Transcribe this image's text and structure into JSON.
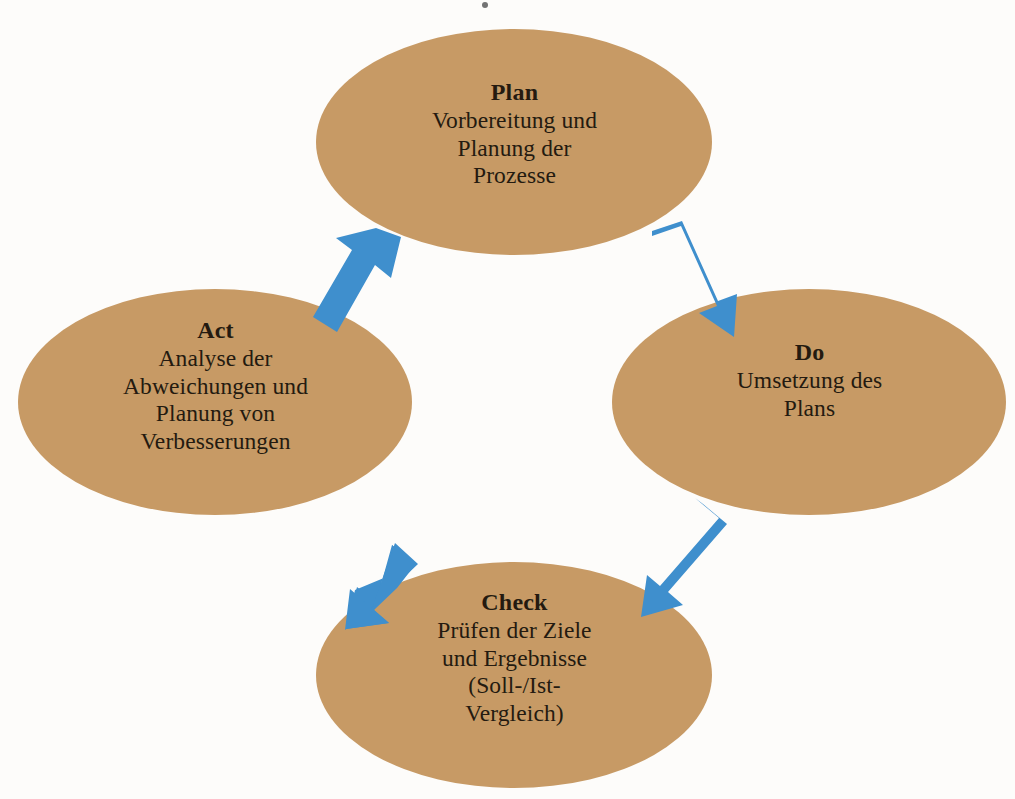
{
  "diagram": {
    "type": "pdca-cycle",
    "direction": "clockwise",
    "colors": {
      "node_fill": "#c79a65",
      "arrow_fill": "#3f8fcd",
      "text": "#241a10",
      "background": "#fdfcfa"
    },
    "nodes": [
      {
        "id": "plan",
        "title": "Plan",
        "body": "Vorbereitung und\nPlanung der\nProzesse",
        "cx": 514,
        "cy": 142,
        "rx": 198,
        "ry": 113
      },
      {
        "id": "do",
        "title": "Do",
        "body": "Umsetzung des\nPlans",
        "cx": 809,
        "cy": 402,
        "rx": 197,
        "ry": 113
      },
      {
        "id": "check",
        "title": "Check",
        "body": "Prüfen der Ziele\nund Ergebnisse\n(Soll-/Ist-\nVergleich)",
        "cx": 514,
        "cy": 675,
        "rx": 198,
        "ry": 113
      },
      {
        "id": "act",
        "title": "Act",
        "body": "Analyse der\nAbweichungen und\nPlanung von\nVerbesserungen",
        "cx": 215,
        "cy": 402,
        "rx": 197,
        "ry": 113
      }
    ],
    "arrows": [
      {
        "id": "plan-to-do",
        "from": "plan",
        "to": "do",
        "direction": "down-right"
      },
      {
        "id": "do-to-check",
        "from": "do",
        "to": "check",
        "direction": "down-left"
      },
      {
        "id": "check-to-act",
        "from": "check",
        "to": "act",
        "direction": "up-left"
      },
      {
        "id": "act-to-plan",
        "from": "act",
        "to": "plan",
        "direction": "up-right"
      }
    ]
  }
}
